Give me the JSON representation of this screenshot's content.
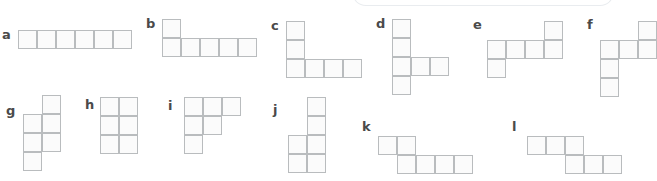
{
  "page": {
    "background_color": "#ffffff",
    "width": 646,
    "height": 181
  },
  "style": {
    "cell_size": 19,
    "cell_fill": "#fbfbfb",
    "cell_border": "#b9bcbe",
    "label_color": "#4a4a4a",
    "panel_border": "#e9ecef"
  },
  "top_panel": {
    "name": "cut-off-rounded-panel",
    "x": 352,
    "y": -10,
    "width": 262,
    "height": 16,
    "ghost_text": ""
  },
  "figures": [
    {
      "id": "a",
      "label": "a",
      "label_x": 2,
      "label_y": 28,
      "origin_x": 18,
      "origin_y": 30,
      "cols": 6,
      "rows": 1,
      "cells": [
        [
          0,
          0
        ],
        [
          1,
          0
        ],
        [
          2,
          0
        ],
        [
          3,
          0
        ],
        [
          4,
          0
        ],
        [
          5,
          0
        ]
      ]
    },
    {
      "id": "b",
      "label": "b",
      "label_x": 146,
      "label_y": 17,
      "origin_x": 162,
      "origin_y": 19,
      "cols": 5,
      "rows": 2,
      "cells": [
        [
          0,
          0
        ],
        [
          0,
          1
        ],
        [
          1,
          1
        ],
        [
          2,
          1
        ],
        [
          3,
          1
        ],
        [
          4,
          1
        ]
      ]
    },
    {
      "id": "c",
      "label": "c",
      "label_x": 271,
      "label_y": 19,
      "origin_x": 286,
      "origin_y": 21,
      "cols": 4,
      "rows": 3,
      "cells": [
        [
          0,
          0
        ],
        [
          0,
          1
        ],
        [
          0,
          2
        ],
        [
          1,
          2
        ],
        [
          2,
          2
        ],
        [
          3,
          2
        ]
      ]
    },
    {
      "id": "d",
      "label": "d",
      "label_x": 376,
      "label_y": 17,
      "origin_x": 392,
      "origin_y": 19,
      "cols": 3,
      "rows": 4,
      "cells": [
        [
          0,
          0
        ],
        [
          0,
          1
        ],
        [
          0,
          2
        ],
        [
          1,
          2
        ],
        [
          2,
          2
        ],
        [
          0,
          3
        ]
      ]
    },
    {
      "id": "e",
      "label": "e",
      "label_x": 473,
      "label_y": 18,
      "origin_x": 487,
      "origin_y": 21,
      "cols": 4,
      "rows": 3,
      "cells": [
        [
          3,
          0
        ],
        [
          0,
          1
        ],
        [
          1,
          1
        ],
        [
          2,
          1
        ],
        [
          3,
          1
        ],
        [
          0,
          2
        ]
      ]
    },
    {
      "id": "f",
      "label": "f",
      "label_x": 587,
      "label_y": 18,
      "origin_x": 600,
      "origin_y": 21,
      "cols": 3,
      "rows": 4,
      "cells": [
        [
          2,
          0
        ],
        [
          0,
          1
        ],
        [
          1,
          1
        ],
        [
          2,
          1
        ],
        [
          0,
          2
        ],
        [
          0,
          3
        ]
      ]
    },
    {
      "id": "g",
      "label": "g",
      "label_x": 6,
      "label_y": 104,
      "origin_x": 23,
      "origin_y": 95,
      "cols": 2,
      "rows": 4,
      "cells": [
        [
          1,
          0
        ],
        [
          0,
          1
        ],
        [
          1,
          1
        ],
        [
          0,
          2
        ],
        [
          1,
          2
        ],
        [
          0,
          3
        ]
      ]
    },
    {
      "id": "h",
      "label": "h",
      "label_x": 85,
      "label_y": 98,
      "origin_x": 100,
      "origin_y": 97,
      "cols": 2,
      "rows": 3,
      "cells": [
        [
          0,
          0
        ],
        [
          1,
          0
        ],
        [
          0,
          1
        ],
        [
          1,
          1
        ],
        [
          0,
          2
        ],
        [
          1,
          2
        ]
      ]
    },
    {
      "id": "i",
      "label": "i",
      "label_x": 168,
      "label_y": 99,
      "origin_x": 184,
      "origin_y": 97,
      "cols": 3,
      "rows": 3,
      "cells": [
        [
          0,
          0
        ],
        [
          1,
          0
        ],
        [
          2,
          0
        ],
        [
          0,
          1
        ],
        [
          1,
          1
        ],
        [
          0,
          2
        ]
      ]
    },
    {
      "id": "j",
      "label": "j",
      "label_x": 273,
      "label_y": 103,
      "origin_x": 288,
      "origin_y": 97,
      "cols": 2,
      "rows": 4,
      "cells": [
        [
          1,
          0
        ],
        [
          1,
          1
        ],
        [
          0,
          2
        ],
        [
          1,
          2
        ],
        [
          0,
          3
        ],
        [
          1,
          3
        ]
      ]
    },
    {
      "id": "k",
      "label": "k",
      "label_x": 362,
      "label_y": 120,
      "origin_x": 378,
      "origin_y": 136,
      "cols": 5,
      "rows": 2,
      "cells": [
        [
          0,
          0
        ],
        [
          1,
          0
        ],
        [
          1,
          1
        ],
        [
          2,
          1
        ],
        [
          3,
          1
        ],
        [
          4,
          1
        ]
      ]
    },
    {
      "id": "l",
      "label": "l",
      "label_x": 512,
      "label_y": 120,
      "origin_x": 527,
      "origin_y": 136,
      "cols": 5,
      "rows": 2,
      "cells": [
        [
          0,
          0
        ],
        [
          1,
          0
        ],
        [
          2,
          0
        ],
        [
          2,
          1
        ],
        [
          3,
          1
        ],
        [
          4,
          1
        ]
      ]
    }
  ]
}
